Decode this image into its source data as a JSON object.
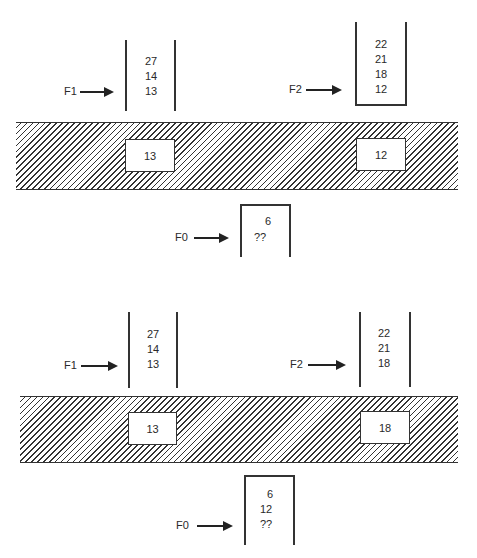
{
  "panels": [
    {
      "name": "top",
      "f1": {
        "label": "F1",
        "values": [
          "27",
          "14",
          "13"
        ]
      },
      "f2": {
        "label": "F2",
        "values": [
          "22",
          "21",
          "18",
          "12"
        ]
      },
      "buffer": {
        "left_slot": "13",
        "right_slot": "12"
      },
      "f0": {
        "label": "F0",
        "values": [
          "6",
          "??"
        ]
      }
    },
    {
      "name": "bottom",
      "f1": {
        "label": "F1",
        "values": [
          "27",
          "14",
          "13"
        ]
      },
      "f2": {
        "label": "F2",
        "values": [
          "22",
          "21",
          "18"
        ]
      },
      "buffer": {
        "left_slot": "13",
        "right_slot": "18"
      },
      "f0": {
        "label": "F0",
        "values": [
          "6",
          "12",
          "??"
        ]
      }
    }
  ]
}
